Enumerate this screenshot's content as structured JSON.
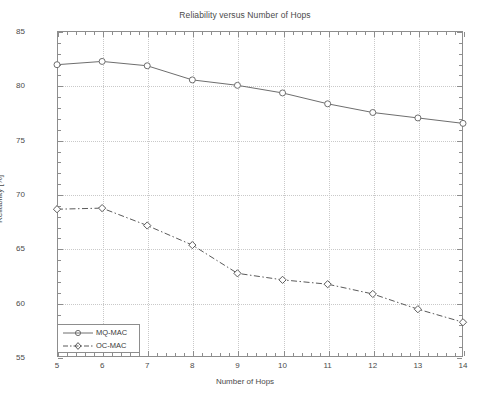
{
  "chart_data": {
    "type": "line",
    "title": "Reliability versus Number of Hops",
    "xlabel": "Number of Hops",
    "ylabel": "Reliability [%]",
    "x": [
      5,
      6,
      7,
      8,
      9,
      10,
      11,
      12,
      13,
      14
    ],
    "xlim": [
      5,
      14
    ],
    "ylim": [
      55,
      85
    ],
    "xticks": [
      "5",
      "6",
      "7",
      "8",
      "9",
      "10",
      "11",
      "12",
      "13",
      "14"
    ],
    "yticks": [
      "55",
      "60",
      "65",
      "70",
      "75",
      "80",
      "85"
    ],
    "grid": true,
    "legend_position": "lower left",
    "series": [
      {
        "name": "MQ-MAC",
        "marker": "circle",
        "linestyle": "solid",
        "color": "#6e6e6e",
        "values": [
          81.9,
          82.2,
          81.8,
          80.5,
          80.0,
          79.3,
          78.3,
          77.5,
          77.0,
          76.5
        ]
      },
      {
        "name": "OC-MAC",
        "marker": "diamond",
        "linestyle": "dash-dot",
        "color": "#5a5a5a",
        "values": [
          68.6,
          68.7,
          67.1,
          65.3,
          62.7,
          62.1,
          61.7,
          60.8,
          59.4,
          58.2
        ]
      }
    ]
  },
  "colors": {
    "axis": "#8d8d8d",
    "grid": "#c9c9c9",
    "text": "#4a4a4a",
    "background": "#ffffff"
  },
  "legend": {
    "items": [
      {
        "label": "MQ-MAC"
      },
      {
        "label": "OC-MAC"
      }
    ]
  }
}
